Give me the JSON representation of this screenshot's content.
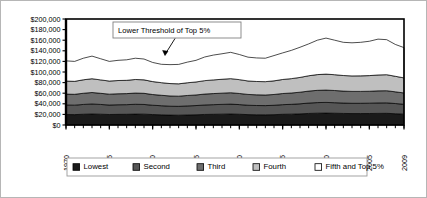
{
  "figure": {
    "background_color": "#ffffff",
    "border_color": "#b6b6b6",
    "plot_border_color": "#000000"
  },
  "annotation": {
    "label": "Lower Threshold of Top 5%",
    "box_border_color": "#808080",
    "arrow_color": "#000000"
  },
  "legend": {
    "items": [
      {
        "label": "Lowest",
        "color": "#1a1a1a"
      },
      {
        "label": "Second",
        "color": "#565656"
      },
      {
        "label": "Third",
        "color": "#6e6e6e"
      },
      {
        "label": "Fourth",
        "color": "#bfbfbf"
      },
      {
        "label": "Fifth and Top 5%",
        "color": "#ffffff"
      }
    ],
    "border_color": "#9a9a9a",
    "position": "bottom"
  },
  "chart_data": {
    "type": "area",
    "stacked": true,
    "title": "",
    "subtitle": "",
    "xlabel": "",
    "ylabel": "",
    "xlim": [
      1970,
      2009
    ],
    "ylim": [
      0,
      200000
    ],
    "yticks": [
      0,
      20000,
      40000,
      60000,
      80000,
      100000,
      120000,
      140000,
      160000,
      180000,
      200000
    ],
    "ytick_labels": [
      "$0",
      "$20,000",
      "$40,000",
      "$60,000",
      "$80,000",
      "$100,000",
      "$120,000",
      "$140,000",
      "$160,000",
      "$180,000",
      "$200,000"
    ],
    "xticks": [
      1970,
      1975,
      1980,
      1985,
      1990,
      1995,
      2000,
      2005,
      2009
    ],
    "xtick_labels": [
      "1970",
      "1975",
      "1980",
      "1985",
      "1990",
      "1995",
      "2000",
      "2005",
      "2009"
    ],
    "xtick_rotation": 90,
    "minor_xticks_every": 1,
    "grid": false,
    "x": [
      1970,
      1971,
      1972,
      1973,
      1974,
      1975,
      1976,
      1977,
      1978,
      1979,
      1980,
      1981,
      1982,
      1983,
      1984,
      1985,
      1986,
      1987,
      1988,
      1989,
      1990,
      1991,
      1992,
      1993,
      1994,
      1995,
      1996,
      1997,
      1998,
      1999,
      2000,
      2001,
      2002,
      2003,
      2004,
      2005,
      2006,
      2007,
      2008,
      2009
    ],
    "series": [
      {
        "name": "Lowest",
        "color": "#1a1a1a",
        "values": [
          19800,
          19600,
          20300,
          20800,
          20400,
          19800,
          20100,
          20200,
          20600,
          20500,
          19700,
          19200,
          18700,
          18500,
          18900,
          19300,
          19900,
          20200,
          20500,
          20800,
          20300,
          19600,
          19300,
          19200,
          19500,
          20200,
          20500,
          21000,
          21800,
          22300,
          22500,
          22200,
          21800,
          21600,
          21600,
          21700,
          21900,
          22000,
          21300,
          20500
        ]
      },
      {
        "name": "Second",
        "color": "#565656",
        "values": [
          18000,
          17900,
          18500,
          18900,
          18400,
          17900,
          18100,
          18200,
          18500,
          18300,
          17600,
          17200,
          16800,
          16700,
          17100,
          17400,
          17900,
          18200,
          18400,
          18600,
          18200,
          17700,
          17500,
          17400,
          17700,
          18200,
          18500,
          19000,
          19600,
          20000,
          20100,
          19900,
          19600,
          19400,
          19400,
          19500,
          19700,
          19800,
          19200,
          18600
        ]
      },
      {
        "name": "Third",
        "color": "#6e6e6e",
        "values": [
          20500,
          20400,
          21100,
          21600,
          21000,
          20500,
          20700,
          20800,
          21200,
          21000,
          20200,
          19700,
          19300,
          19200,
          19700,
          20000,
          20600,
          20900,
          21200,
          21500,
          21000,
          20400,
          20100,
          20000,
          20400,
          21000,
          21400,
          21900,
          22600,
          23100,
          23300,
          23000,
          22600,
          22400,
          22400,
          22500,
          22800,
          22900,
          22100,
          21400
        ]
      },
      {
        "name": "Fourth",
        "color": "#bfbfbf",
        "values": [
          24600,
          24500,
          25400,
          26000,
          25300,
          24700,
          25000,
          25100,
          25600,
          25400,
          24400,
          23800,
          23400,
          23300,
          24000,
          24500,
          25300,
          25800,
          26200,
          26600,
          26100,
          25400,
          25200,
          25200,
          25700,
          26500,
          27100,
          27900,
          28900,
          29700,
          30100,
          29800,
          29400,
          29200,
          29300,
          29500,
          30000,
          30200,
          29300,
          28400
        ]
      },
      {
        "name": "Fifth and Top 5%",
        "color": "#ffffff",
        "values": [
          38100,
          37600,
          40700,
          42700,
          39900,
          37100,
          38100,
          38700,
          40100,
          39300,
          36100,
          34600,
          35700,
          36600,
          38900,
          40800,
          44600,
          46800,
          48100,
          49600,
          47400,
          44900,
          44400,
          44200,
          47700,
          50100,
          53300,
          56900,
          60100,
          64900,
          68000,
          65100,
          62600,
          62500,
          63300,
          64800,
          67600,
          66100,
          60100,
          57100
        ]
      }
    ],
    "series_note": "Stacked bands; top of stack is the Lower Threshold of the Top 5%",
    "top_line_label": "Lower Threshold of Top 5%",
    "top_line_values": [
      121000,
      120000,
      126000,
      130000,
      125000,
      120000,
      122000,
      123000,
      126000,
      124500,
      118000,
      114500,
      114000,
      114300,
      119600,
      122000,
      128300,
      131900,
      134400,
      137100,
      133000,
      128000,
      126500,
      126000,
      131000,
      136000,
      140800,
      146700,
      153000,
      160000,
      164000,
      160000,
      156000,
      155100,
      156000,
      158000,
      162000,
      161000,
      152000,
      146000
    ]
  }
}
